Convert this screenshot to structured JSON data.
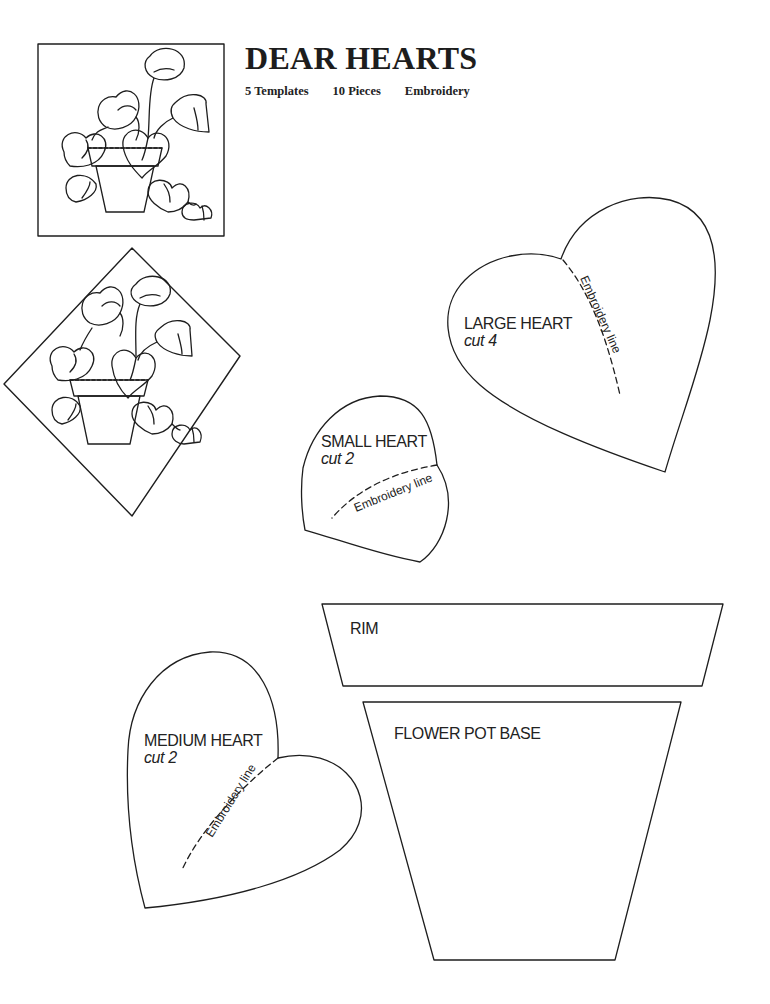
{
  "header": {
    "title": "DEAR HEARTS",
    "meta": [
      "5 Templates",
      "10 Pieces",
      "Embroidery"
    ]
  },
  "illustrations": {
    "square_block": "Block design preview (square)",
    "diamond_block": "Block design preview (on point)"
  },
  "templates": {
    "large_heart": {
      "name": "LARGE HEART",
      "cut": "cut 4",
      "embroidery": "Embroidery line"
    },
    "small_heart": {
      "name": "SMALL HEART",
      "cut": "cut 2",
      "embroidery": "Embroidery line"
    },
    "medium_heart": {
      "name": "MEDIUM HEART",
      "cut": "cut 2",
      "embroidery": "Embroidery line"
    },
    "rim": {
      "name": "RIM"
    },
    "pot_base": {
      "name": "FLOWER POT BASE"
    }
  },
  "colors": {
    "line": "#1e1e1e",
    "paper": "#ffffff"
  }
}
